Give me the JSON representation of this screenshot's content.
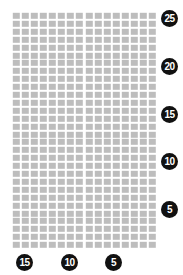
{
  "chart_data": {
    "type": "heatmap",
    "title": "",
    "subtitle": "",
    "xlabel": "",
    "ylabel": "",
    "grid": true,
    "legend_position": "none",
    "background_color": "#ffffff",
    "cell_color": "#bdbdbd",
    "gap_color": "#ffffff",
    "label_bg_color": "#111111",
    "label_text_color": "#ffffff",
    "columns": 16,
    "rows": 30,
    "x_axis": {
      "position": "bottom",
      "direction": "decreasing-left-to-right",
      "tick_labels": [
        "15",
        "10",
        "5"
      ],
      "tick_positions_px": [
        24,
        69,
        113
      ]
    },
    "y_axis": {
      "position": "right",
      "direction": "decreasing-top-to-bottom",
      "tick_labels": [
        "25",
        "20",
        "15",
        "10",
        "5"
      ],
      "tick_positions_px": [
        18,
        66,
        114,
        161,
        209
      ]
    },
    "values": [
      [
        1,
        1,
        1,
        1,
        1,
        1,
        1,
        1,
        1,
        1,
        1,
        1,
        1,
        1,
        1,
        1
      ],
      [
        1,
        1,
        1,
        1,
        1,
        1,
        1,
        1,
        1,
        1,
        1,
        1,
        1,
        1,
        1,
        1
      ],
      [
        1,
        1,
        1,
        1,
        1,
        1,
        1,
        1,
        1,
        1,
        1,
        1,
        1,
        1,
        1,
        1
      ],
      [
        1,
        1,
        1,
        1,
        1,
        1,
        1,
        1,
        1,
        1,
        1,
        1,
        1,
        1,
        1,
        1
      ],
      [
        1,
        1,
        1,
        1,
        1,
        1,
        1,
        1,
        1,
        1,
        1,
        1,
        1,
        1,
        1,
        1
      ],
      [
        1,
        1,
        1,
        1,
        1,
        1,
        1,
        1,
        1,
        1,
        1,
        1,
        1,
        1,
        1,
        1
      ],
      [
        1,
        1,
        1,
        1,
        1,
        1,
        1,
        1,
        1,
        1,
        1,
        1,
        1,
        1,
        1,
        1
      ],
      [
        1,
        1,
        1,
        1,
        1,
        1,
        1,
        1,
        1,
        1,
        1,
        1,
        1,
        1,
        1,
        1
      ],
      [
        1,
        1,
        1,
        1,
        1,
        1,
        1,
        1,
        1,
        1,
        1,
        1,
        1,
        1,
        1,
        1
      ],
      [
        1,
        1,
        1,
        1,
        1,
        1,
        1,
        1,
        1,
        1,
        1,
        1,
        1,
        1,
        1,
        1
      ],
      [
        1,
        1,
        1,
        1,
        1,
        1,
        1,
        1,
        1,
        1,
        1,
        1,
        1,
        1,
        1,
        1
      ],
      [
        1,
        1,
        1,
        1,
        1,
        1,
        1,
        1,
        1,
        1,
        1,
        1,
        1,
        1,
        1,
        1
      ],
      [
        1,
        1,
        1,
        1,
        1,
        1,
        1,
        1,
        1,
        1,
        1,
        1,
        1,
        1,
        1,
        1
      ],
      [
        1,
        1,
        1,
        1,
        1,
        1,
        1,
        1,
        1,
        1,
        1,
        1,
        1,
        1,
        1,
        1
      ],
      [
        1,
        1,
        1,
        1,
        1,
        1,
        1,
        1,
        1,
        1,
        1,
        1,
        1,
        1,
        1,
        1
      ],
      [
        1,
        1,
        1,
        1,
        1,
        1,
        1,
        1,
        1,
        1,
        1,
        1,
        1,
        1,
        1,
        1
      ],
      [
        1,
        1,
        1,
        1,
        1,
        1,
        1,
        1,
        1,
        1,
        1,
        1,
        1,
        1,
        1,
        1
      ],
      [
        1,
        1,
        1,
        1,
        1,
        1,
        1,
        1,
        1,
        1,
        1,
        1,
        1,
        1,
        1,
        1
      ],
      [
        1,
        1,
        1,
        1,
        1,
        1,
        1,
        1,
        1,
        1,
        1,
        1,
        1,
        1,
        1,
        1
      ],
      [
        1,
        1,
        1,
        1,
        1,
        1,
        1,
        1,
        1,
        1,
        1,
        1,
        1,
        1,
        1,
        1
      ],
      [
        1,
        1,
        1,
        1,
        1,
        1,
        1,
        1,
        1,
        1,
        1,
        1,
        1,
        1,
        1,
        1
      ],
      [
        1,
        1,
        1,
        1,
        1,
        1,
        1,
        1,
        1,
        1,
        1,
        1,
        1,
        1,
        1,
        1
      ],
      [
        1,
        1,
        1,
        1,
        1,
        1,
        1,
        1,
        1,
        1,
        1,
        1,
        1,
        1,
        1,
        1
      ],
      [
        1,
        1,
        1,
        1,
        1,
        1,
        1,
        1,
        1,
        1,
        1,
        1,
        1,
        1,
        1,
        1
      ],
      [
        1,
        1,
        1,
        1,
        1,
        1,
        1,
        1,
        1,
        1,
        1,
        1,
        1,
        1,
        1,
        1
      ],
      [
        1,
        1,
        1,
        1,
        1,
        1,
        1,
        1,
        1,
        1,
        1,
        1,
        1,
        1,
        1,
        1
      ],
      [
        1,
        1,
        1,
        1,
        1,
        1,
        1,
        1,
        1,
        1,
        1,
        1,
        1,
        1,
        1,
        1
      ],
      [
        1,
        1,
        1,
        1,
        1,
        1,
        1,
        1,
        1,
        1,
        1,
        1,
        1,
        1,
        1,
        1
      ],
      [
        1,
        1,
        1,
        1,
        1,
        1,
        1,
        1,
        1,
        1,
        1,
        1,
        1,
        1,
        1,
        1
      ],
      [
        1,
        1,
        1,
        1,
        1,
        1,
        1,
        1,
        1,
        1,
        1,
        1,
        1,
        1,
        1,
        1
      ]
    ]
  }
}
